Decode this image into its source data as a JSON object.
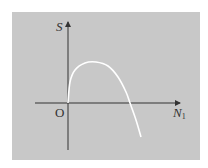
{
  "figure": {
    "background_color": "#c8c8c8",
    "curve_color": "#ffffff",
    "axis_color": "#333333"
  },
  "chart_data": {
    "type": "line",
    "title": "",
    "xlabel": "N",
    "xlabel_subscript": "1",
    "ylabel": "S",
    "origin_label": "O",
    "grid": false,
    "legend": false,
    "series": [
      {
        "name": "S(N1)",
        "points_px": [
          [
            68,
            103
          ],
          [
            70,
            82
          ],
          [
            75,
            70
          ],
          [
            85,
            63
          ],
          [
            96,
            62
          ],
          [
            108,
            66
          ],
          [
            118,
            77
          ],
          [
            126,
            92
          ],
          [
            130,
            103
          ],
          [
            136,
            120
          ],
          [
            141,
            137
          ]
        ]
      }
    ]
  }
}
